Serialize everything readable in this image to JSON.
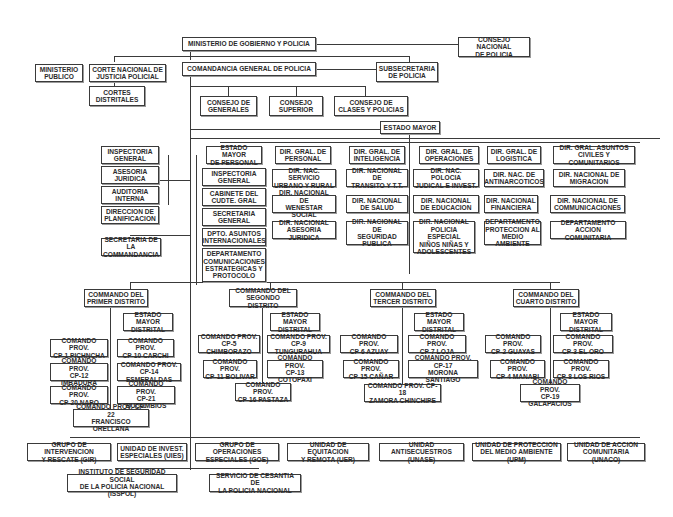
{
  "top": {
    "ministerio": "MINISTERIO DE GOBIERNO Y POLICIA",
    "consejo_nacional": "CONSEJO NACIONAL\nDE POLICIA",
    "ministerio_publico": "MINISTERIO\nPUBLICO",
    "corte_nacional": "CORTE NACIONAL DE\nJUSTICIA POLICIAL",
    "cortes_distritales": "CORTES\nDISTRITALES",
    "comandancia": "COMANDANCIA GENERAL DE POLICIA",
    "subsecretaria": "SUBSECRETARIA\nDE POLICIA"
  },
  "consejos": [
    "CONSEJO DE\nGENERALES",
    "CONSEJO\nSUPERIOR",
    "CONSEJO DE\nCLASES Y POLICIAS"
  ],
  "estado_mayor": "ESTADO MAYOR",
  "left_staff": [
    "INSPECTORIA\nGENERAL",
    "ASESORIA\nJURIDICA",
    "AUDITORIA\nINTERNA",
    "DIRECCION DE\nPLANIFICACION"
  ],
  "secretaria_comandancia": "SECRETARIA DE\nLA COMMANDANCIA",
  "estado_mayor_personal": {
    "head": "ESTADO MAYOR\nDE PERSONAL",
    "items": [
      "INSPECTORIA\nGENERAL",
      "CABINETE DEL\nCUDTE. GRAL",
      "SECRETARIA\nGENERAL",
      "DPTO. ASUNTOS\nINTERNACIONALES",
      "DEPARTAMENTO\nCOMUNICACIONES\nESTRATEGICAS Y\nPROTOCOLO"
    ]
  },
  "direcciones_generales": [
    {
      "head": "DIR. GRAL. DE\nPERSONAL",
      "items": [
        "DIR. NAC. SERVICIO\nURBANO Y RURAL",
        "DIR. NACIONAL DE\nWENESTAR SOCIAL",
        "DIR. NACIONAL\nASESORIA JURIDICA"
      ]
    },
    {
      "head": "DIR. GRAL. DE\nINTELIGENCIA",
      "items": [
        "DIR. NACIONAL DE\nTRANSITO Y T.T.",
        "DIR. NACIONAL\nDE SALUD",
        "DIR. NACIONAL DE\nSEGURIDAD\nPUBLICA"
      ]
    },
    {
      "head": "DIR. GRAL. DE\nOPERACIONES",
      "items": [
        "DIR. NAC. POLOCIA\nJUDICAL E INVEST.",
        "DIR. NACIONAL\nDE EDUCACION",
        "DIR. NACIONAL\nPOLICIA ESPECIAL\nNIÑOS NIÑAS Y\nADOLESCENTES"
      ]
    },
    {
      "head": "DIR. GRAL. DE\nLOGISTICA",
      "items": [
        "DIR. NAC. DE\nANTINARCOTICOS",
        "DIR. NACIONAL\nFINANCIERA",
        "DEPARTAMENTO\nPROTECCION AL\nMEDIO AMBIENTE"
      ]
    },
    {
      "head": "DIR. GRAL. ASUNTOS\nCIVILES Y COMUNITARIOS",
      "items": [
        "DIR. NACIONAL DE\nMIGRACION",
        "DIR. NACIONAL DE\nCOMMUNICACIONES",
        "DEPARTAMENTO\nACCION COMUNITARIA"
      ]
    }
  ],
  "distritos": [
    {
      "head": "COMMANDO DEL\nPRIMER DISTRITO",
      "estado": "ESTADO MAYOR\nDISTRITAL",
      "provs": [
        "COMANDO PROV.\nCP-1 PICHNCHA",
        "COMANDO PROV.\nCP-10 CARCHI",
        "COMANDO PROV.\nCP-12 IMBADURA",
        "COMANDO PROV.\nCP-14 ESMERALDAS",
        "COMANDO PROV.\nCP-20 NAPO",
        "COMANDO PROV.\nCP-21 BUCUMBIOS",
        "COMANDO PROV. CP-22\nFRANCISCO ORELLANA"
      ]
    },
    {
      "head": "COMMANDO DEL\nSEGONDO DISTRITO",
      "estado": "ESTADO MAYOR\nDISTRITAL",
      "provs": [
        "COMANDO PROV.\nCP-5 CHIMBORAZO",
        "COMANDO PROV.\nCP-9 TUNGURAHUA",
        "COMANDO PROV.\nCP-11 BOLIVAR",
        "COMANDO PROV.\nCP-13 COTOPAXI",
        "COMANDO PROV.\nCP-16 PASTAZA"
      ]
    },
    {
      "head": "COMMANDO DEL\nTERCER DISTRITO",
      "estado": "ESTADO MAYOR\nDISTRITAL",
      "provs": [
        "COMANDO PROV.\nCP-6 AZUAY",
        "COMANDO PROV.\nCP-7 LOJA",
        "COMANDO PROV.\nCP-15 CAÑAR",
        "COMANDO PROV. CP-17\nMORONA SANTIAGO",
        "COMANDO PROV. CP-18\nZAMORA CHINCHIPE"
      ]
    },
    {
      "head": "COMMANDO DEL\nCUARTO DISTRITO",
      "estado": "ESTADO MAYOR\nDISTRITAL",
      "provs": [
        "COMANDO PROV.\nCP-2 GUAYAS",
        "COMANDO PROV.\nCP-3 EL ORO",
        "COMANDO PROV.\nCP-4 MANABI",
        "COMANDO PROV.\nCP-8 LOS RIOS",
        "COMANDO PROV.\nCP-19 GALAPACIOS"
      ]
    }
  ],
  "unidades": [
    "GRUPO DE INTERVENCION\nY RESCATE (GIR)",
    "UNIDAD DE INVEST.\nESPECIALES (UIES)",
    "GRUPO DE OPERACIONES\nESPECIALES (GOE)",
    "UNIDAD DE EQUITACION\nY REMOTA (UER)",
    "UNIDAD ANTISECUESTROS\n(UNASE)",
    "UNIDAD DE PROTECCION\nDEL MEDIO AMBIENTE (UPM)",
    "UNIDAD DE ACCION\nCOMUNITARIA (UNACO)"
  ],
  "servicios": [
    "INSTITUTO DE SEGURIDAD SOCIAL\nDE LA POLICIA NACIONAL (ISSPOL)",
    "SERVICIO DE CESANTIA DE\nLA POLICIA NACIONAL"
  ]
}
